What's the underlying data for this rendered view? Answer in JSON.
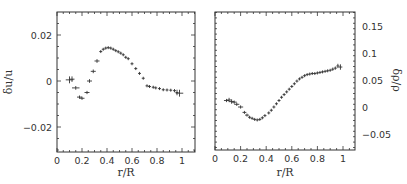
{
  "chart_data": [
    {
      "type": "scatter",
      "panel": "left",
      "title": "",
      "xlabel": "r/R",
      "ylabel": "δu/u",
      "xlim": [
        0,
        1.1
      ],
      "ylim": [
        -0.03,
        0.03
      ],
      "xticks": [
        "0",
        "0.2",
        "0.4",
        "0.6",
        "0.8",
        "1"
      ],
      "yticks": [
        "0.02",
        "0",
        "−0.02"
      ],
      "ytick_values": [
        0.02,
        0,
        -0.02
      ],
      "xtick_values": [
        0,
        0.2,
        0.4,
        0.6,
        0.8,
        1.0
      ],
      "grid": false,
      "marker": "errorbar-cross",
      "points": [
        {
          "x": 0.1,
          "y": 0.0005,
          "xerr": 0.03,
          "yerr": 0.0015
        },
        {
          "x": 0.12,
          "y": 0.0008,
          "xerr": 0.02,
          "yerr": 0.0012
        },
        {
          "x": 0.15,
          "y": -0.003,
          "xerr": 0.03,
          "yerr": 0.0008
        },
        {
          "x": 0.18,
          "y": -0.007,
          "xerr": 0.02,
          "yerr": 0.0007
        },
        {
          "x": 0.2,
          "y": -0.0075,
          "xerr": 0.02,
          "yerr": 0.0007
        },
        {
          "x": 0.24,
          "y": -0.005,
          "xerr": 0.02,
          "yerr": 0.0007
        },
        {
          "x": 0.26,
          "y": 0.0,
          "xerr": 0.02,
          "yerr": 0.0008
        },
        {
          "x": 0.29,
          "y": 0.0042,
          "xerr": 0.02,
          "yerr": 0.0008
        },
        {
          "x": 0.32,
          "y": 0.0087,
          "xerr": 0.02,
          "yerr": 0.0008
        },
        {
          "x": 0.35,
          "y": 0.0128,
          "xerr": 0.012,
          "yerr": 0.0006
        },
        {
          "x": 0.37,
          "y": 0.0138,
          "xerr": 0.012,
          "yerr": 0.0006
        },
        {
          "x": 0.39,
          "y": 0.0143,
          "xerr": 0.012,
          "yerr": 0.0006
        },
        {
          "x": 0.41,
          "y": 0.0145,
          "xerr": 0.012,
          "yerr": 0.0006
        },
        {
          "x": 0.43,
          "y": 0.0143,
          "xerr": 0.012,
          "yerr": 0.0006
        },
        {
          "x": 0.45,
          "y": 0.0138,
          "xerr": 0.012,
          "yerr": 0.0006
        },
        {
          "x": 0.47,
          "y": 0.0132,
          "xerr": 0.012,
          "yerr": 0.0006
        },
        {
          "x": 0.49,
          "y": 0.0127,
          "xerr": 0.012,
          "yerr": 0.0006
        },
        {
          "x": 0.51,
          "y": 0.0121,
          "xerr": 0.012,
          "yerr": 0.0006
        },
        {
          "x": 0.53,
          "y": 0.0114,
          "xerr": 0.012,
          "yerr": 0.0006
        },
        {
          "x": 0.55,
          "y": 0.0103,
          "xerr": 0.012,
          "yerr": 0.0006
        },
        {
          "x": 0.57,
          "y": 0.0097,
          "xerr": 0.012,
          "yerr": 0.0006
        },
        {
          "x": 0.6,
          "y": 0.0075,
          "xerr": 0.012,
          "yerr": 0.0006
        },
        {
          "x": 0.63,
          "y": 0.0054,
          "xerr": 0.012,
          "yerr": 0.0006
        },
        {
          "x": 0.66,
          "y": 0.0033,
          "xerr": 0.012,
          "yerr": 0.0006
        },
        {
          "x": 0.69,
          "y": 0.0012,
          "xerr": 0.012,
          "yerr": 0.0006
        },
        {
          "x": 0.72,
          "y": -0.0021,
          "xerr": 0.012,
          "yerr": 0.0006
        },
        {
          "x": 0.74,
          "y": -0.0024,
          "xerr": 0.012,
          "yerr": 0.0006
        },
        {
          "x": 0.77,
          "y": -0.0027,
          "xerr": 0.012,
          "yerr": 0.0006
        },
        {
          "x": 0.79,
          "y": -0.003,
          "xerr": 0.012,
          "yerr": 0.0006
        },
        {
          "x": 0.82,
          "y": -0.0033,
          "xerr": 0.012,
          "yerr": 0.0006
        },
        {
          "x": 0.85,
          "y": -0.0038,
          "xerr": 0.012,
          "yerr": 0.0006
        },
        {
          "x": 0.88,
          "y": -0.0039,
          "xerr": 0.012,
          "yerr": 0.0006
        },
        {
          "x": 0.91,
          "y": -0.004,
          "xerr": 0.012,
          "yerr": 0.0006
        },
        {
          "x": 0.94,
          "y": -0.0042,
          "xerr": 0.012,
          "yerr": 0.0007
        },
        {
          "x": 0.96,
          "y": -0.005,
          "xerr": 0.012,
          "yerr": 0.0012
        },
        {
          "x": 0.98,
          "y": -0.0053,
          "xerr": 0.03,
          "yerr": 0.0015
        }
      ]
    },
    {
      "type": "scatter",
      "panel": "right",
      "title": "",
      "xlabel": "r/R",
      "ylabel": "δρ/ρ",
      "xlim": [
        0,
        1.1
      ],
      "ylim": [
        -0.075,
        0.175
      ],
      "xticks": [
        "0",
        "0.2",
        "0.4",
        "0.6",
        "0.8",
        "1"
      ],
      "yticks": [
        "0.15",
        "0.1",
        "0.05",
        "0",
        "−0.05"
      ],
      "ytick_values": [
        0.15,
        0.1,
        0.05,
        0,
        -0.05
      ],
      "xtick_values": [
        0,
        0.2,
        0.4,
        0.6,
        0.8,
        1.0
      ],
      "yaxis_position": "right",
      "grid": false,
      "marker": "errorbar-cross",
      "points": [
        {
          "x": 0.09,
          "y": 0.012,
          "xerr": 0.02,
          "yerr": 0.003
        },
        {
          "x": 0.11,
          "y": 0.013,
          "xerr": 0.02,
          "yerr": 0.004
        },
        {
          "x": 0.13,
          "y": 0.01,
          "xerr": 0.02,
          "yerr": 0.004
        },
        {
          "x": 0.15,
          "y": 0.009,
          "xerr": 0.02,
          "yerr": 0.003
        },
        {
          "x": 0.17,
          "y": 0.005,
          "xerr": 0.02,
          "yerr": 0.003
        },
        {
          "x": 0.2,
          "y": 0.0,
          "xerr": 0.02,
          "yerr": 0.003
        },
        {
          "x": 0.23,
          "y": -0.01,
          "xerr": 0.015,
          "yerr": 0.002
        },
        {
          "x": 0.25,
          "y": -0.015,
          "xerr": 0.015,
          "yerr": 0.002
        },
        {
          "x": 0.27,
          "y": -0.019,
          "xerr": 0.012,
          "yerr": 0.002
        },
        {
          "x": 0.29,
          "y": -0.021,
          "xerr": 0.012,
          "yerr": 0.002
        },
        {
          "x": 0.31,
          "y": -0.023,
          "xerr": 0.012,
          "yerr": 0.002
        },
        {
          "x": 0.33,
          "y": -0.024,
          "xerr": 0.012,
          "yerr": 0.002
        },
        {
          "x": 0.35,
          "y": -0.023,
          "xerr": 0.012,
          "yerr": 0.002
        },
        {
          "x": 0.37,
          "y": -0.02,
          "xerr": 0.012,
          "yerr": 0.002
        },
        {
          "x": 0.39,
          "y": -0.016,
          "xerr": 0.012,
          "yerr": 0.002
        },
        {
          "x": 0.42,
          "y": -0.011,
          "xerr": 0.01,
          "yerr": 0.002
        },
        {
          "x": 0.44,
          "y": -0.006,
          "xerr": 0.01,
          "yerr": 0.002
        },
        {
          "x": 0.46,
          "y": 0.0,
          "xerr": 0.01,
          "yerr": 0.002
        },
        {
          "x": 0.48,
          "y": 0.006,
          "xerr": 0.01,
          "yerr": 0.002
        },
        {
          "x": 0.5,
          "y": 0.012,
          "xerr": 0.01,
          "yerr": 0.002
        },
        {
          "x": 0.52,
          "y": 0.018,
          "xerr": 0.01,
          "yerr": 0.002
        },
        {
          "x": 0.54,
          "y": 0.023,
          "xerr": 0.01,
          "yerr": 0.002
        },
        {
          "x": 0.56,
          "y": 0.028,
          "xerr": 0.01,
          "yerr": 0.002
        },
        {
          "x": 0.58,
          "y": 0.033,
          "xerr": 0.01,
          "yerr": 0.002
        },
        {
          "x": 0.6,
          "y": 0.038,
          "xerr": 0.01,
          "yerr": 0.002
        },
        {
          "x": 0.62,
          "y": 0.043,
          "xerr": 0.01,
          "yerr": 0.002
        },
        {
          "x": 0.64,
          "y": 0.048,
          "xerr": 0.01,
          "yerr": 0.002
        },
        {
          "x": 0.66,
          "y": 0.052,
          "xerr": 0.01,
          "yerr": 0.002
        },
        {
          "x": 0.68,
          "y": 0.055,
          "xerr": 0.01,
          "yerr": 0.002
        },
        {
          "x": 0.7,
          "y": 0.058,
          "xerr": 0.01,
          "yerr": 0.002
        },
        {
          "x": 0.72,
          "y": 0.06,
          "xerr": 0.01,
          "yerr": 0.002
        },
        {
          "x": 0.74,
          "y": 0.061,
          "xerr": 0.01,
          "yerr": 0.002
        },
        {
          "x": 0.76,
          "y": 0.062,
          "xerr": 0.01,
          "yerr": 0.002
        },
        {
          "x": 0.78,
          "y": 0.062,
          "xerr": 0.01,
          "yerr": 0.002
        },
        {
          "x": 0.8,
          "y": 0.063,
          "xerr": 0.01,
          "yerr": 0.002
        },
        {
          "x": 0.82,
          "y": 0.064,
          "xerr": 0.01,
          "yerr": 0.002
        },
        {
          "x": 0.84,
          "y": 0.065,
          "xerr": 0.01,
          "yerr": 0.002
        },
        {
          "x": 0.86,
          "y": 0.066,
          "xerr": 0.01,
          "yerr": 0.002
        },
        {
          "x": 0.88,
          "y": 0.067,
          "xerr": 0.01,
          "yerr": 0.002
        },
        {
          "x": 0.9,
          "y": 0.068,
          "xerr": 0.01,
          "yerr": 0.002
        },
        {
          "x": 0.92,
          "y": 0.07,
          "xerr": 0.01,
          "yerr": 0.003
        },
        {
          "x": 0.94,
          "y": 0.072,
          "xerr": 0.01,
          "yerr": 0.003
        },
        {
          "x": 0.96,
          "y": 0.076,
          "xerr": 0.01,
          "yerr": 0.004
        },
        {
          "x": 0.98,
          "y": 0.074,
          "xerr": 0.015,
          "yerr": 0.005
        }
      ]
    }
  ],
  "colors": {
    "ink": "#333333",
    "background": "#ffffff"
  }
}
